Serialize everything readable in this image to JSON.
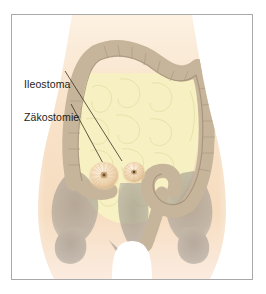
{
  "figure": {
    "kind": "medical-illustration",
    "language": "de",
    "border_color": "#a9a9a9",
    "background_color": "#ffffff"
  },
  "labels": [
    {
      "id": "ileostoma",
      "text": "Ileostoma",
      "color": "#1d1d1b",
      "leader_line": {
        "from_x": 64,
        "from_y": 67,
        "to_x": 120,
        "to_y": 157,
        "color": "#3a3226"
      },
      "points_to": "right-stoma"
    },
    {
      "id": "zaekostomie",
      "text": "Zäkostomie",
      "color": "#1d1d1b",
      "leader_line": {
        "from_x": 70,
        "from_y": 100,
        "to_x": 103,
        "to_y": 161,
        "color": "#3a3226"
      },
      "points_to": "left-stoma"
    }
  ],
  "anatomy": {
    "body_fill": "#f7e0c6",
    "body_fill_light": "#fbeedd",
    "small_intestine_fill": "#f6f0c0",
    "small_intestine_line": "#e3dca0",
    "colon_fill": "#c3b197",
    "colon_line": "#9c8a72",
    "pelvis_fill": "#9a948c",
    "stoma_outer": "#f2d9b4",
    "stoma_mid": "#f8e9d2",
    "stoma_center": "#8b6a46",
    "parts": [
      {
        "name": "torso-silhouette",
        "label": "Rumpf"
      },
      {
        "name": "small-intestine",
        "label": "Dünndarm"
      },
      {
        "name": "colon",
        "label": "Dickdarm"
      },
      {
        "name": "pelvis",
        "label": "Becken"
      },
      {
        "name": "left-stoma",
        "label": "Zäkostomie-Stoma"
      },
      {
        "name": "right-stoma",
        "label": "Ileostoma-Stoma"
      }
    ]
  }
}
